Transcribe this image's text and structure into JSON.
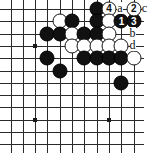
{
  "diagram": {
    "kind": "go-board-diagram",
    "title": "",
    "board_size": 19,
    "view": {
      "columns_visible": 11,
      "rows_visible": 12,
      "corner": "top-right"
    },
    "geometry": {
      "origin_x": 10.5,
      "origin_y": 9.0,
      "step_x": 12.3,
      "step_y": 12.3,
      "cols": 11,
      "rows": 12
    },
    "colors": {
      "board_background": "#ffffff",
      "grid_line": "#2a2a2a",
      "black_stone": "#111111",
      "white_stone": "#ffffff",
      "white_stone_edge": "#141414",
      "label_text": "#111111",
      "black_number_text": "#ffffff",
      "white_number_text": "#111111"
    },
    "hoshi": [
      {
        "col": 2,
        "row": 3
      },
      {
        "col": 2,
        "row": 9
      },
      {
        "col": 8,
        "row": 9
      }
    ],
    "stones": [
      {
        "col": 7,
        "row": 0,
        "color": "black",
        "label": ""
      },
      {
        "col": 8,
        "row": 0,
        "color": "white",
        "label": "4"
      },
      {
        "col": 4,
        "row": 1,
        "color": "white",
        "label": ""
      },
      {
        "col": 5,
        "row": 1,
        "color": "black",
        "label": ""
      },
      {
        "col": 7,
        "row": 1,
        "color": "black",
        "label": ""
      },
      {
        "col": 8,
        "row": 1,
        "color": "white",
        "label": ""
      },
      {
        "col": 9,
        "row": 1,
        "color": "black",
        "label": "1"
      },
      {
        "col": 10,
        "row": 1,
        "color": "black",
        "label": "3"
      },
      {
        "col": 3,
        "row": 2,
        "color": "black",
        "label": ""
      },
      {
        "col": 4,
        "row": 2,
        "color": "black",
        "label": ""
      },
      {
        "col": 5,
        "row": 2,
        "color": "white",
        "label": ""
      },
      {
        "col": 6,
        "row": 2,
        "color": "black",
        "label": ""
      },
      {
        "col": 7,
        "row": 2,
        "color": "black",
        "label": ""
      },
      {
        "col": 8,
        "row": 2,
        "color": "white",
        "label": ""
      },
      {
        "col": 5,
        "row": 3,
        "color": "white",
        "label": ""
      },
      {
        "col": 6,
        "row": 3,
        "color": "white",
        "label": ""
      },
      {
        "col": 7,
        "row": 3,
        "color": "white",
        "label": ""
      },
      {
        "col": 8,
        "row": 3,
        "color": "white",
        "label": ""
      },
      {
        "col": 9,
        "row": 3,
        "color": "white",
        "label": ""
      },
      {
        "col": 3,
        "row": 4,
        "color": "black",
        "label": ""
      },
      {
        "col": 6,
        "row": 4,
        "color": "black",
        "label": ""
      },
      {
        "col": 7,
        "row": 4,
        "color": "black",
        "label": ""
      },
      {
        "col": 8,
        "row": 4,
        "color": "black",
        "label": ""
      },
      {
        "col": 9,
        "row": 4,
        "color": "black",
        "label": ""
      },
      {
        "col": 10,
        "row": 4,
        "color": "white",
        "label": ""
      },
      {
        "col": 4,
        "row": 5,
        "color": "black",
        "label": ""
      },
      {
        "col": 9,
        "row": 6,
        "color": "black",
        "label": ""
      }
    ],
    "point_labels": [
      {
        "col": 9,
        "row": 0,
        "text": "a"
      },
      {
        "col": 10,
        "row": 2,
        "text": "b"
      },
      {
        "col": 11,
        "row": 0,
        "text": "c"
      },
      {
        "col": 10,
        "row": 3,
        "text": "d"
      }
    ],
    "numbered_moves": [
      {
        "number": "1",
        "color": "black"
      },
      {
        "number": "2",
        "color": "white"
      },
      {
        "number": "3",
        "color": "black"
      },
      {
        "number": "4",
        "color": "white"
      }
    ],
    "extra_white_numbered": [
      {
        "col": 10,
        "row": 0,
        "color": "white",
        "label": "2"
      }
    ],
    "corner_mark": ""
  }
}
